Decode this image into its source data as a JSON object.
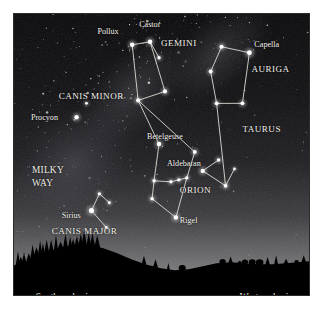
{
  "figure": {
    "kind": "star-chart",
    "frame_border_color": "#2b2b2b",
    "sky_top_color": "#0a0a0c",
    "sky_horizon_color": "#8e8e8e",
    "ground_color": "#000000",
    "line_color": "#e8e6de",
    "star_color": "#ffffff",
    "label_color": "#f2f0ea"
  },
  "star_labels": [
    {
      "id": "pollux",
      "text": "Pollux",
      "x": 84,
      "y": 20,
      "anchor": "start"
    },
    {
      "id": "castor",
      "text": "Castor",
      "x": 126,
      "y": 13,
      "anchor": "start"
    },
    {
      "id": "capella",
      "text": "Capella",
      "x": 242,
      "y": 33,
      "anchor": "start"
    },
    {
      "id": "procyon",
      "text": "Procyon",
      "x": 17,
      "y": 107,
      "anchor": "start"
    },
    {
      "id": "betelgeuse",
      "text": "Betelgeuse",
      "x": 134,
      "y": 126,
      "anchor": "start"
    },
    {
      "id": "aldebaran",
      "text": "Aldebaran",
      "x": 154,
      "y": 153,
      "anchor": "start"
    },
    {
      "id": "rigel",
      "text": "Rigel",
      "x": 167,
      "y": 211,
      "anchor": "start"
    },
    {
      "id": "sirius",
      "text": "Sirius",
      "x": 48,
      "y": 205,
      "anchor": "start"
    }
  ],
  "constellation_labels": [
    {
      "id": "gemini",
      "text": "GEMINI",
      "x": 148,
      "y": 32,
      "anchor": "start"
    },
    {
      "id": "auriga",
      "text": "AURIGA",
      "x": 239,
      "y": 58,
      "anchor": "start"
    },
    {
      "id": "canis-minor",
      "text": "CANIS MINOR",
      "x": 45,
      "y": 86,
      "anchor": "start"
    },
    {
      "id": "taurus",
      "text": "TAURUS",
      "x": 230,
      "y": 119,
      "anchor": "start"
    },
    {
      "id": "orion",
      "text": "ORION",
      "x": 167,
      "y": 180,
      "anchor": "start"
    },
    {
      "id": "canis-major",
      "text": "CANIS MAJOR",
      "x": 38,
      "y": 222,
      "anchor": "start"
    }
  ],
  "region_labels": [
    {
      "id": "milky-way-line1",
      "text": "MILKY",
      "x": 18,
      "y": 160
    },
    {
      "id": "milky-way-line2",
      "text": "WAY",
      "x": 18,
      "y": 173
    }
  ],
  "horizon_labels": [
    {
      "id": "southern-horizon",
      "text": "Southern horizon",
      "x": 22,
      "y": 288,
      "anchor": "start"
    },
    {
      "id": "western-horizon",
      "text": "Western horizon",
      "x": 290,
      "y": 288,
      "anchor": "end"
    }
  ],
  "stars": [
    {
      "id": "pollux",
      "x": 119,
      "y": 31,
      "r": 2.3
    },
    {
      "id": "castor",
      "x": 137,
      "y": 28,
      "r": 2.3
    },
    {
      "id": "gem-sw",
      "x": 125,
      "y": 87,
      "r": 2.1
    },
    {
      "id": "gem-se",
      "x": 152,
      "y": 78,
      "r": 2.1
    },
    {
      "id": "gem-e",
      "x": 146,
      "y": 44,
      "r": 1.7
    },
    {
      "id": "aur-capella",
      "x": 237,
      "y": 39,
      "r": 2.5
    },
    {
      "id": "aur-n",
      "x": 209,
      "y": 33,
      "r": 2.1
    },
    {
      "id": "aur-w",
      "x": 198,
      "y": 58,
      "r": 2.0
    },
    {
      "id": "aur-sw",
      "x": 204,
      "y": 90,
      "r": 2.0
    },
    {
      "id": "aur-s",
      "x": 230,
      "y": 90,
      "r": 2.0
    },
    {
      "id": "procyon",
      "x": 63,
      "y": 104,
      "r": 2.2
    },
    {
      "id": "cmi-north",
      "x": 73,
      "y": 90,
      "r": 1.4
    },
    {
      "id": "betelgeuse",
      "x": 146,
      "y": 131,
      "r": 2.3
    },
    {
      "id": "ori-shoulder",
      "x": 182,
      "y": 139,
      "r": 2.0
    },
    {
      "id": "ori-belt1",
      "x": 158,
      "y": 169,
      "r": 1.7
    },
    {
      "id": "ori-belt2",
      "x": 166,
      "y": 167,
      "r": 1.7
    },
    {
      "id": "ori-belt3",
      "x": 174,
      "y": 165,
      "r": 1.7
    },
    {
      "id": "ori-rigel",
      "x": 163,
      "y": 205,
      "r": 2.3
    },
    {
      "id": "ori-saiph",
      "x": 139,
      "y": 186,
      "r": 1.8
    },
    {
      "id": "ori-bellatrix",
      "x": 141,
      "y": 168,
      "r": 1.7
    },
    {
      "id": "tau-aldebaran",
      "x": 190,
      "y": 158,
      "r": 2.2
    },
    {
      "id": "tau-v1",
      "x": 206,
      "y": 147,
      "r": 1.8
    },
    {
      "id": "tau-v2",
      "x": 213,
      "y": 173,
      "r": 1.9
    },
    {
      "id": "tau-tip",
      "x": 222,
      "y": 156,
      "r": 1.3
    },
    {
      "id": "sirius",
      "x": 78,
      "y": 198,
      "r": 2.6
    },
    {
      "id": "cma-n",
      "x": 86,
      "y": 181,
      "r": 1.6
    },
    {
      "id": "cma-e",
      "x": 96,
      "y": 190,
      "r": 1.5
    },
    {
      "id": "cma-s",
      "x": 93,
      "y": 215,
      "r": 1.6
    }
  ],
  "constellation_lines": [
    {
      "id": "gemini-shape",
      "points": "119,31 137,28 152,78 125,87 119,31"
    },
    {
      "id": "gemini-castor-spur",
      "points": "137,28 146,44"
    },
    {
      "id": "gemini-leg-west",
      "points": "125,87 146,131"
    },
    {
      "id": "gemini-leg-east",
      "points": "125,87 182,139"
    },
    {
      "id": "auriga-shape",
      "points": "209,33 237,39 230,90 204,90 198,58 209,33"
    },
    {
      "id": "auriga-taurus-link",
      "points": "204,90 213,173"
    },
    {
      "id": "orion-body",
      "points": "146,131 141,168 139,186 163,205 174,165 182,139"
    },
    {
      "id": "orion-belt",
      "points": "158,169 166,167 174,165"
    },
    {
      "id": "orion-belt-to-body",
      "points": "141,168 158,169"
    },
    {
      "id": "taurus-v-upper",
      "points": "190,158 206,147"
    },
    {
      "id": "taurus-v-lower",
      "points": "190,158 213,173"
    },
    {
      "id": "taurus-tip",
      "points": "213,173 222,156"
    },
    {
      "id": "cma-spur-n",
      "points": "78,198 86,181"
    },
    {
      "id": "cma-spur-e",
      "points": "86,181 96,190"
    },
    {
      "id": "cma-spur-s",
      "points": "78,198 93,215"
    }
  ],
  "horizon_profile": "M0,283 L0,253 L10,250 L22,244 L34,239 L48,235 L62,233 L76,233 L90,236 L104,241 L118,247 L132,252 L148,256 L162,258 L176,257 L190,254 L204,251 L218,250 L232,251 L246,252 L260,252 L274,251 L286,250 L297,249 L297,283 Z"
}
